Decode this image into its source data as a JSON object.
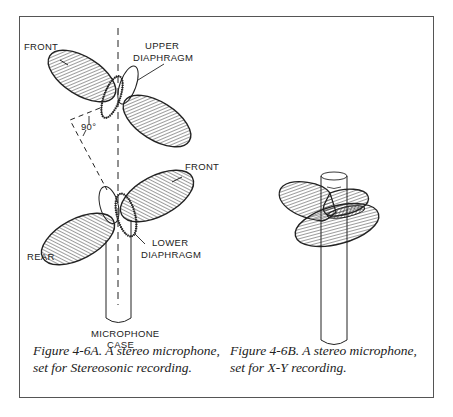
{
  "figure_a": {
    "labels": {
      "front_upper": "FRONT",
      "upper_diaphragm_1": "UPPER",
      "upper_diaphragm_2": "DIAPHRAGM",
      "angle": "90°",
      "front_lower": "FRONT",
      "rear": "REAR",
      "lower_diaphragm_1": "LOWER",
      "lower_diaphragm_2": "DIAPHRAGM",
      "case_1": "MICROPHONE",
      "case_2": "CASE"
    },
    "caption": {
      "line1": "Figure 4-6A. A stereo microphone,",
      "line2": "set for Stereosonic recording."
    }
  },
  "figure_b": {
    "caption": {
      "line1": "Figure 4-6B. A stereo microphone,",
      "line2": "set for X-Y recording."
    }
  },
  "colors": {
    "ink": "#222222",
    "frame": "#555555",
    "background": "#ffffff"
  }
}
